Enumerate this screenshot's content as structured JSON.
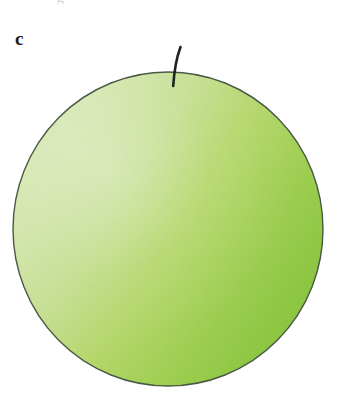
{
  "figure": {
    "panel_label": "c",
    "clipped_text_above": "g",
    "background_color": "#ffffff"
  },
  "fruit": {
    "shape": "circle",
    "body_name": "apple-body",
    "stem_name": "apple-stem",
    "outline_color": "#4a5a46",
    "outline_width": 1.4,
    "center_x": 168,
    "center_y": 229,
    "radius_x": 155,
    "radius_y": 157,
    "gradient": {
      "type": "linear-horizontal",
      "stops": [
        {
          "offset": 0.0,
          "color": "#d9e9b6"
        },
        {
          "offset": 0.16,
          "color": "#d3e6a9"
        },
        {
          "offset": 0.34,
          "color": "#c6e092"
        },
        {
          "offset": 0.52,
          "color": "#b6d96c"
        },
        {
          "offset": 0.72,
          "color": "#a0d053"
        },
        {
          "offset": 0.88,
          "color": "#90c944"
        },
        {
          "offset": 1.0,
          "color": "#87c43c"
        }
      ]
    },
    "stem": {
      "color": "#1d2419",
      "width": 2.6,
      "top_x": 180,
      "top_y": 47,
      "base_x": 173,
      "base_y": 86
    }
  }
}
